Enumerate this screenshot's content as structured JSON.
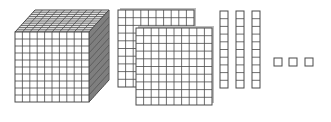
{
  "figure": {
    "colors": {
      "line": "#4a4a4a",
      "fill": "#ffffff",
      "shade": "#9a9a9a",
      "background": "#ffffff"
    },
    "groups": [
      {
        "name": "thousands",
        "type": "cube",
        "count": 1,
        "grid": 10
      },
      {
        "name": "hundreds",
        "type": "flat",
        "count": 2,
        "grid": 10
      },
      {
        "name": "tens",
        "type": "rod",
        "count": 3,
        "grid": 10
      },
      {
        "name": "ones",
        "type": "unit",
        "count": 3,
        "grid": 1
      }
    ]
  }
}
